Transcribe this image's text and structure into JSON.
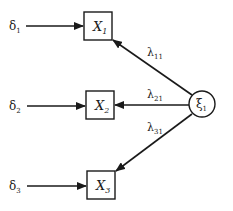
{
  "diagram": {
    "type": "path-diagram",
    "latent": {
      "id": "xi1",
      "label": "ξ",
      "sub": "1"
    },
    "observed": [
      {
        "id": "X1",
        "label": "X",
        "sub": "1"
      },
      {
        "id": "X2",
        "label": "X",
        "sub": "2"
      },
      {
        "id": "X3",
        "label": "X",
        "sub": "3"
      }
    ],
    "errors": [
      {
        "id": "delta1",
        "label": "δ",
        "sub": "1",
        "target": "X1"
      },
      {
        "id": "delta2",
        "label": "δ",
        "sub": "2",
        "target": "X2"
      },
      {
        "id": "delta3",
        "label": "δ",
        "sub": "3",
        "target": "X3"
      }
    ],
    "loadings": [
      {
        "id": "lambda11",
        "label": "λ",
        "sub": "11",
        "from": "xi1",
        "to": "X1"
      },
      {
        "id": "lambda21",
        "label": "λ",
        "sub": "21",
        "from": "xi1",
        "to": "X2"
      },
      {
        "id": "lambda31",
        "label": "λ",
        "sub": "31",
        "from": "xi1",
        "to": "X3"
      }
    ]
  }
}
